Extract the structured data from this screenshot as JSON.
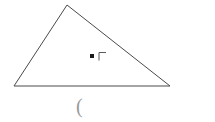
{
  "figure": {
    "type": "triangle-with-interior-point",
    "background_color": "#ffffff",
    "stroke_color": "#4a4a4a",
    "stroke_width": 1,
    "canvas": {
      "width": 215,
      "height": 122
    },
    "triangle": {
      "name": "triangle",
      "vertices": [
        {
          "label": "left-vertex",
          "x": 14,
          "y": 86
        },
        {
          "label": "apex-vertex",
          "x": 67,
          "y": 5
        },
        {
          "label": "right-vertex",
          "x": 170,
          "y": 86
        }
      ],
      "points_path": "14,86 67,5 170,86"
    },
    "interior_point": {
      "name": "interior-point",
      "shape": "filled-square",
      "x": 92,
      "y": 56,
      "size": 4,
      "color": "#1a1a1a"
    },
    "right_angle_marker": {
      "name": "right-angle-marker",
      "glyph": "corner-bracket",
      "x": 99,
      "y": 52,
      "width": 7,
      "height": 8,
      "color": "#5a5a5a",
      "path": "M 99 60 L 99 52.5 L 106 52.5"
    },
    "paren_mark": {
      "name": "paren-mark",
      "text": "(",
      "x": 76,
      "y": 96,
      "color": "#9a9a9a"
    }
  },
  "ghost_text": {
    "left": "    ",
    "right": "   "
  }
}
